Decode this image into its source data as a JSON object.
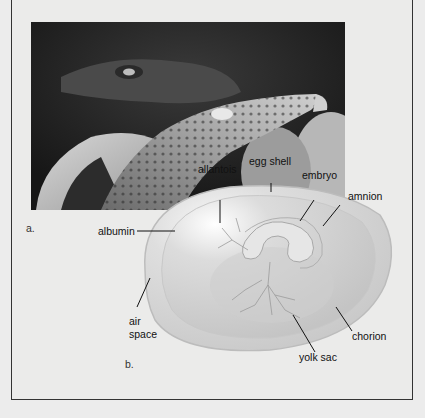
{
  "figure": {
    "panels": [
      {
        "id": "a",
        "label": "a.",
        "content": "photo of hatching crocodile"
      },
      {
        "id": "b",
        "label": "b.",
        "content": "diagram of amniotic egg"
      }
    ],
    "labels": {
      "egg_shell": "egg shell",
      "allantois": "allantois",
      "embryo": "embryo",
      "amnion": "amnion",
      "albumin": "albumin",
      "air_space_line1": "air",
      "air_space_line2": "space",
      "chorion": "chorion",
      "yolk_sac": "yolk sac"
    },
    "colors": {
      "background": "#ebebea",
      "frame_border": "#333333",
      "egg_fill": "#d6d6d6",
      "label_text": "#111111"
    }
  }
}
